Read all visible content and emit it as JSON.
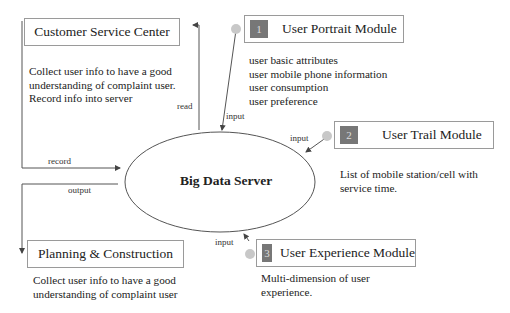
{
  "customer_service": {
    "title": "Customer Service Center",
    "description": [
      "Collect user info to have a good",
      "understanding of complaint user.",
      "Record info into server"
    ]
  },
  "planning": {
    "title": "Planning & Construction",
    "description": [
      "Collect user info to have a good",
      "understanding of complaint user"
    ]
  },
  "server": {
    "label": "Big Data Server"
  },
  "modules": [
    {
      "number": "1",
      "title": "User Portrait Module",
      "description": [
        "user basic attributes",
        "user mobile phone information",
        "user consumption",
        "user preference"
      ]
    },
    {
      "number": "2",
      "title": "User Trail Module",
      "description": [
        "List of mobile station/cell with",
        "service time."
      ]
    },
    {
      "number": "3",
      "title": "User Experience Module",
      "description": [
        "Multi-dimension of user",
        "experience."
      ]
    }
  ],
  "edge_labels": {
    "read": "read",
    "record": "record",
    "output": "output",
    "input1": "input",
    "input2": "input",
    "input3": "input"
  },
  "colors": {
    "line": "#555555",
    "box_border": "#9a9a9a",
    "number_badge": "#777777",
    "dot": "#c8c8c8"
  }
}
